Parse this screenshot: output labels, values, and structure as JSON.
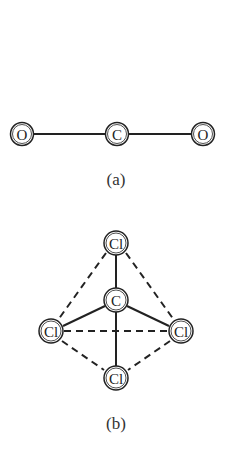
{
  "figure_a": {
    "caption": "(a)",
    "atoms": [
      {
        "label": "O",
        "x": 22,
        "y": 134
      },
      {
        "label": "C",
        "x": 117,
        "y": 134
      },
      {
        "label": "O",
        "x": 203,
        "y": 134
      }
    ],
    "bonds": [
      [
        0,
        1,
        "solid"
      ],
      [
        1,
        2,
        "solid"
      ]
    ]
  },
  "figure_b": {
    "caption": "(b)",
    "atoms": [
      {
        "label": "Cl",
        "x": 116,
        "y": 243
      },
      {
        "label": "C",
        "x": 116,
        "y": 300
      },
      {
        "label": "Cl",
        "x": 51,
        "y": 331
      },
      {
        "label": "Cl",
        "x": 181,
        "y": 331
      },
      {
        "label": "Cl",
        "x": 116,
        "y": 378
      }
    ],
    "bonds": [
      [
        0,
        1,
        "solid"
      ],
      [
        1,
        2,
        "solid"
      ],
      [
        1,
        3,
        "solid"
      ],
      [
        1,
        4,
        "solid"
      ],
      [
        0,
        2,
        "dashed"
      ],
      [
        0,
        3,
        "dashed"
      ],
      [
        2,
        3,
        "dashed"
      ],
      [
        2,
        4,
        "dashed"
      ],
      [
        3,
        4,
        "dashed"
      ]
    ]
  },
  "colors": {
    "line": "#222222",
    "background": "#ffffff"
  }
}
